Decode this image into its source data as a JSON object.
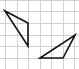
{
  "diagram": {
    "type": "grid-with-triangles",
    "grid": {
      "color": "#d0d0d0",
      "vertical_lines_x": [
        5,
        17,
        28,
        40,
        51,
        63,
        74
      ],
      "horizontal_lines_y": [
        0,
        11,
        23,
        35,
        46,
        58,
        69
      ]
    },
    "shapes": [
      {
        "name": "triangle-left",
        "points": [
          [
            5,
            11
          ],
          [
            28,
            23
          ],
          [
            28,
            46
          ]
        ],
        "stroke": "#111111"
      },
      {
        "name": "triangle-right",
        "points": [
          [
            40,
            58
          ],
          [
            63,
            58
          ],
          [
            75,
            35
          ]
        ],
        "stroke": "#111111"
      }
    ]
  }
}
